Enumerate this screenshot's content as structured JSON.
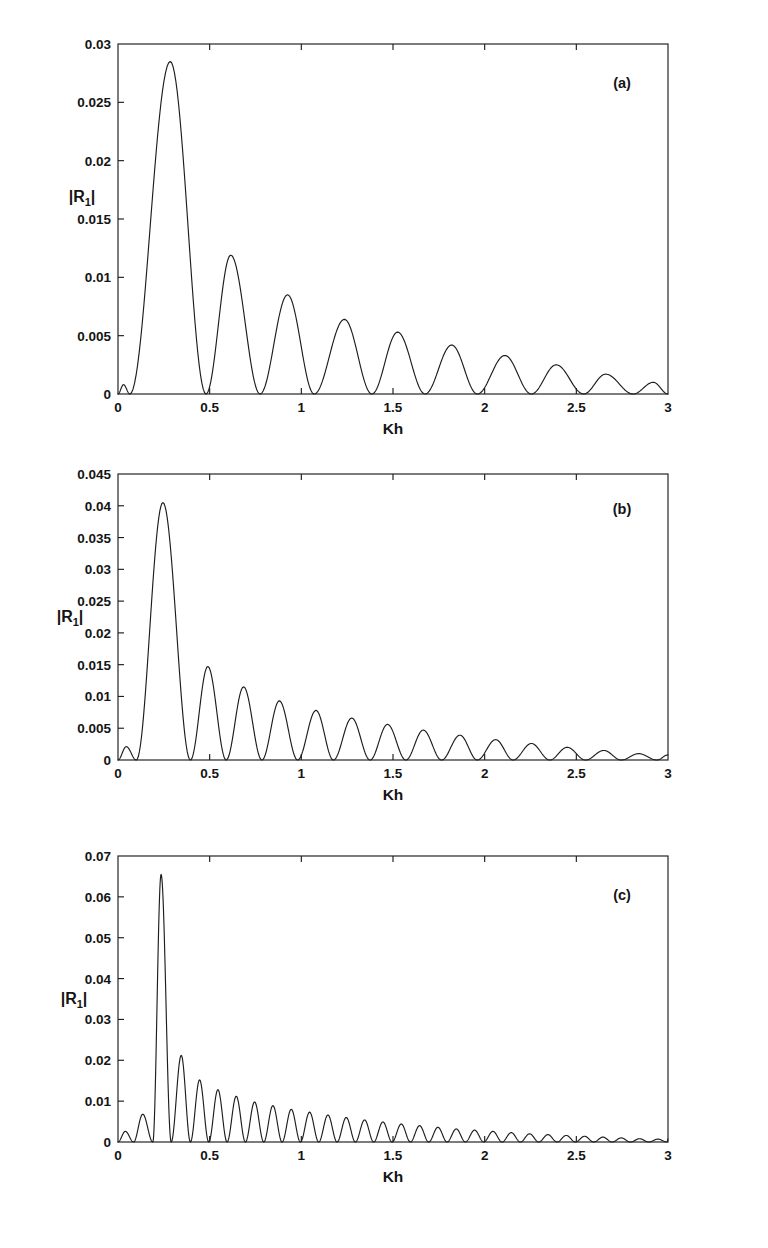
{
  "figure": {
    "background": "#ffffff",
    "line_color": "#1d1d1d",
    "panels": [
      {
        "tag": "(a)",
        "xlabel": "Kh",
        "ylabel": "|R",
        "ylabel_sub": "1",
        "ylabel_end": "|",
        "xticks": [
          "0",
          "0.5",
          "1",
          "1.5",
          "2",
          "2.5",
          "3"
        ],
        "xtick_values": [
          0,
          0.5,
          1,
          1.5,
          2,
          2.5,
          3
        ],
        "yticks": [
          "0",
          "0.005",
          "0.01",
          "0.015",
          "0.02",
          "0.025",
          "0.03"
        ],
        "ytick_values": [
          0,
          0.005,
          0.01,
          0.015,
          0.02,
          0.025,
          0.03
        ]
      },
      {
        "tag": "(b)",
        "xlabel": "Kh",
        "ylabel": "|R",
        "ylabel_sub": "1",
        "ylabel_end": "|",
        "xticks": [
          "0",
          "0.5",
          "1",
          "1.5",
          "2",
          "2.5",
          "3"
        ],
        "xtick_values": [
          0,
          0.5,
          1,
          1.5,
          2,
          2.5,
          3
        ],
        "yticks": [
          "0",
          "0.005",
          "0.01",
          "0.015",
          "0.02",
          "0.025",
          "0.03",
          "0.035",
          "0.04",
          "0.045"
        ],
        "ytick_values": [
          0,
          0.005,
          0.01,
          0.015,
          0.02,
          0.025,
          0.03,
          0.035,
          0.04,
          0.045
        ]
      },
      {
        "tag": "(c)",
        "xlabel": "Kh",
        "ylabel": "|R",
        "ylabel_sub": "1",
        "ylabel_end": "|",
        "xticks": [
          "0",
          "0.5",
          "1",
          "1.5",
          "2",
          "2.5",
          "3"
        ],
        "xtick_values": [
          0,
          0.5,
          1,
          1.5,
          2,
          2.5,
          3
        ],
        "yticks": [
          "0",
          "0.01",
          "0.02",
          "0.03",
          "0.04",
          "0.05",
          "0.06",
          "0.07"
        ],
        "ytick_values": [
          0,
          0.01,
          0.02,
          0.03,
          0.04,
          0.05,
          0.06,
          0.07
        ]
      }
    ]
  },
  "chart_data": [
    {
      "type": "line",
      "title": "",
      "panel": "(a)",
      "xlabel": "Kh",
      "ylabel": "|R1|",
      "xlim": [
        0,
        3
      ],
      "ylim": [
        0,
        0.03
      ],
      "grid": false,
      "legend": "none",
      "description": "Oscillatory decaying reflection-coefficient magnitude with a dominant first lobe",
      "curve_model": {
        "form": "envelope_times_abs_sine",
        "zero_spacing": 0.2925,
        "first_zero": 0.065,
        "peak_x": 0.285,
        "peak_y": 0.0285,
        "envelope_decay": 1.02,
        "tail_y": 0.0009
      },
      "lobe_peaks": [
        {
          "x": 0.03,
          "y": 0.0008
        },
        {
          "x": 0.285,
          "y": 0.0285
        },
        {
          "x": 0.615,
          "y": 0.0119
        },
        {
          "x": 0.925,
          "y": 0.0085
        },
        {
          "x": 1.235,
          "y": 0.0064
        },
        {
          "x": 1.525,
          "y": 0.0053
        },
        {
          "x": 1.82,
          "y": 0.0042
        },
        {
          "x": 2.11,
          "y": 0.0033
        },
        {
          "x": 2.39,
          "y": 0.0025
        },
        {
          "x": 2.66,
          "y": 0.0017
        },
        {
          "x": 2.92,
          "y": 0.001
        }
      ],
      "zeros": [
        0.065,
        0.48,
        0.775,
        1.07,
        1.385,
        1.675,
        1.96,
        2.255,
        2.54,
        2.81
      ]
    },
    {
      "type": "line",
      "title": "",
      "panel": "(b)",
      "xlabel": "Kh",
      "ylabel": "|R1|",
      "xlim": [
        0,
        3
      ],
      "ylim": [
        0,
        0.045
      ],
      "grid": false,
      "legend": "none",
      "description": "Oscillatory decaying reflection-coefficient magnitude with denser lobes than panel (a)",
      "curve_model": {
        "form": "envelope_times_abs_sine",
        "zero_spacing": 0.196,
        "first_zero": 0.1,
        "peak_x": 0.245,
        "peak_y": 0.0405,
        "envelope_decay": 1.35,
        "tail_y": 0.0008
      },
      "lobe_peaks": [
        {
          "x": 0.045,
          "y": 0.0021
        },
        {
          "x": 0.245,
          "y": 0.0405
        },
        {
          "x": 0.49,
          "y": 0.0147
        },
        {
          "x": 0.685,
          "y": 0.0115
        },
        {
          "x": 0.88,
          "y": 0.0093
        },
        {
          "x": 1.08,
          "y": 0.0078
        },
        {
          "x": 1.275,
          "y": 0.0066
        },
        {
          "x": 1.47,
          "y": 0.0056
        },
        {
          "x": 1.665,
          "y": 0.0047
        },
        {
          "x": 1.865,
          "y": 0.0039
        },
        {
          "x": 2.06,
          "y": 0.0032
        },
        {
          "x": 2.255,
          "y": 0.0026
        },
        {
          "x": 2.45,
          "y": 0.002
        },
        {
          "x": 2.65,
          "y": 0.0015
        },
        {
          "x": 2.84,
          "y": 0.001
        }
      ],
      "zeros": [
        0.1,
        0.395,
        0.59,
        0.785,
        0.98,
        1.175,
        1.375,
        1.57,
        1.765,
        1.96,
        2.155,
        2.355,
        2.55,
        2.745,
        2.94
      ]
    },
    {
      "type": "line",
      "title": "",
      "panel": "(c)",
      "xlabel": "Kh",
      "ylabel": "|R1|",
      "xlim": [
        0,
        3
      ],
      "ylim": [
        0,
        0.07
      ],
      "grid": false,
      "legend": "none",
      "description": "Oscillatory decaying reflection-coefficient magnitude with the tallest first lobe and the densest oscillations",
      "curve_model": {
        "form": "envelope_times_abs_sine",
        "zero_spacing": 0.1,
        "first_zero": 0.085,
        "peak_x": 0.235,
        "peak_y": 0.0655,
        "envelope_decay": 1.55,
        "tail_y": 0.0007
      },
      "lobe_peaks": [
        {
          "x": 0.04,
          "y": 0.0026
        },
        {
          "x": 0.135,
          "y": 0.0068
        },
        {
          "x": 0.235,
          "y": 0.0655
        },
        {
          "x": 0.345,
          "y": 0.0212
        },
        {
          "x": 0.445,
          "y": 0.0152
        },
        {
          "x": 0.545,
          "y": 0.0128
        },
        {
          "x": 0.645,
          "y": 0.0112
        },
        {
          "x": 0.745,
          "y": 0.0098
        },
        {
          "x": 0.845,
          "y": 0.0089
        },
        {
          "x": 0.945,
          "y": 0.008
        },
        {
          "x": 1.045,
          "y": 0.0073
        },
        {
          "x": 1.145,
          "y": 0.0066
        },
        {
          "x": 1.245,
          "y": 0.006
        },
        {
          "x": 1.345,
          "y": 0.0054
        },
        {
          "x": 1.445,
          "y": 0.0049
        },
        {
          "x": 1.545,
          "y": 0.0044
        },
        {
          "x": 1.645,
          "y": 0.004
        },
        {
          "x": 1.745,
          "y": 0.0036
        },
        {
          "x": 1.845,
          "y": 0.0032
        },
        {
          "x": 1.945,
          "y": 0.0029
        },
        {
          "x": 2.045,
          "y": 0.0026
        },
        {
          "x": 2.145,
          "y": 0.0023
        },
        {
          "x": 2.245,
          "y": 0.002
        },
        {
          "x": 2.345,
          "y": 0.0018
        },
        {
          "x": 2.445,
          "y": 0.0016
        },
        {
          "x": 2.545,
          "y": 0.0014
        },
        {
          "x": 2.645,
          "y": 0.0012
        },
        {
          "x": 2.745,
          "y": 0.001
        },
        {
          "x": 2.845,
          "y": 0.0008
        },
        {
          "x": 2.945,
          "y": 0.0007
        }
      ],
      "zeros": [
        0.085,
        0.19,
        0.29,
        0.395,
        0.495,
        0.595,
        0.695,
        0.795,
        0.895,
        0.995,
        1.095,
        1.195,
        1.295,
        1.395,
        1.495,
        1.595,
        1.695,
        1.795,
        1.895,
        1.995,
        2.095,
        2.195,
        2.295,
        2.395,
        2.495,
        2.595,
        2.695,
        2.795,
        2.895,
        2.995
      ]
    }
  ]
}
